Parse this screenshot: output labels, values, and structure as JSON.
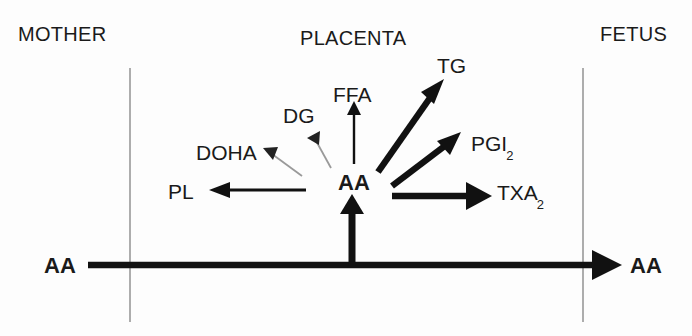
{
  "figure": {
    "background_color": "#fdfdfd",
    "line_color": "#111111",
    "thin_line_color": "#8a8a8a"
  },
  "compartments": [
    {
      "key": "mother",
      "label": "MOTHER",
      "x": 18,
      "y": 24
    },
    {
      "key": "placenta",
      "label": "PLACENTA",
      "x": 300,
      "y": 28
    },
    {
      "key": "fetus",
      "label": "FETUS",
      "x": 600,
      "y": 24
    }
  ],
  "boundaries": [
    {
      "name": "maternal-placental-boundary",
      "x": 130,
      "y1": 68,
      "y2": 322
    },
    {
      "name": "placental-fetal-boundary",
      "x": 583,
      "y1": 68,
      "y2": 322
    }
  ],
  "nodes": {
    "maternal_aa": {
      "label": "AA",
      "bold": true,
      "x": 44,
      "y": 255
    },
    "fetal_aa": {
      "label": "AA",
      "bold": true,
      "x": 630,
      "y": 255
    },
    "central_aa": {
      "label": "AA",
      "bold": true,
      "x": 338,
      "y": 172
    },
    "pl": {
      "label": "PL",
      "bold": false,
      "x": 168,
      "y": 181
    },
    "doha": {
      "label": "DOHA",
      "bold": false,
      "x": 196,
      "y": 142
    },
    "dg": {
      "label": "DG",
      "bold": false,
      "x": 283,
      "y": 105
    },
    "ffa": {
      "label": "FFA",
      "bold": false,
      "x": 333,
      "y": 84
    },
    "tg": {
      "label": "TG",
      "bold": false,
      "x": 437,
      "y": 55
    },
    "pgi2": {
      "label": "PGI",
      "subscript": "2",
      "bold": false,
      "x": 471,
      "y": 133
    },
    "txa2": {
      "label": "TXA",
      "subscript": "2",
      "bold": false,
      "x": 497,
      "y": 182
    }
  },
  "arrows": [
    {
      "name": "transfer-mother-to-fetus",
      "from": "maternal_aa",
      "to": "fetal_aa",
      "weight": "thick",
      "x1": 88,
      "y1": 265,
      "x2": 608,
      "y2": 265
    },
    {
      "name": "uptake-into-aa-pool",
      "from": "transfer_line",
      "to": "central_aa",
      "weight": "thick",
      "x1": 352,
      "y1": 263,
      "x2": 352,
      "y2": 200
    },
    {
      "name": "aa-to-pl",
      "from": "central_aa",
      "to": "pl",
      "weight": "medium",
      "x1": 302,
      "y1": 190,
      "x2": 212,
      "y2": 190
    },
    {
      "name": "aa-to-doha",
      "from": "central_aa",
      "to": "doha",
      "weight": "thin",
      "x1": 300,
      "y1": 175,
      "x2": 264,
      "y2": 149
    },
    {
      "name": "aa-to-dg",
      "from": "central_aa",
      "to": "dg",
      "weight": "thin",
      "x1": 330,
      "y1": 167,
      "x2": 310,
      "y2": 132
    },
    {
      "name": "aa-to-ffa",
      "from": "central_aa",
      "to": "ffa",
      "weight": "thin",
      "x1": 354,
      "y1": 162,
      "x2": 354,
      "y2": 104
    },
    {
      "name": "aa-to-tg",
      "from": "central_aa",
      "to": "tg",
      "weight": "thick",
      "x1": 378,
      "y1": 172,
      "x2": 443,
      "y2": 82
    },
    {
      "name": "aa-to-pgi2",
      "from": "central_aa",
      "to": "pgi2",
      "weight": "thick",
      "x1": 392,
      "y1": 185,
      "x2": 458,
      "y2": 134
    },
    {
      "name": "aa-to-txa2",
      "from": "central_aa",
      "to": "txa2",
      "weight": "thick",
      "x1": 392,
      "y1": 196,
      "x2": 487,
      "y2": 196
    }
  ]
}
